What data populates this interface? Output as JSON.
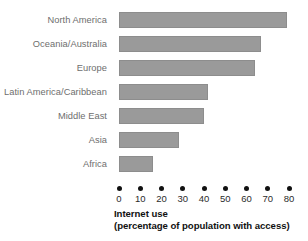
{
  "chart_data": {
    "type": "bar",
    "orientation": "horizontal",
    "title": "Internet use",
    "subtitle": "(percentage of population with access)",
    "xlabel": "Internet use (percentage of population with access)",
    "ylabel": "",
    "categories": [
      "North America",
      "Oceania/Australia",
      "Europe",
      "Latin America/Caribbean",
      "Middle East",
      "Asia",
      "Africa"
    ],
    "values": [
      79,
      67,
      64,
      42,
      40,
      28,
      16
    ],
    "xlim": [
      0,
      80
    ],
    "xticks": [
      0,
      10,
      20,
      30,
      40,
      50,
      60,
      70,
      80
    ],
    "xtick_labels": [
      "0",
      "10",
      "20",
      "30",
      "40",
      "50",
      "60",
      "70",
      "80"
    ],
    "grid": false,
    "legend": false,
    "bar_color": "#9a9a9a",
    "tick_marker": "dot",
    "background": "#ffffff"
  },
  "axis_title": {
    "line1": "Internet use",
    "line2": "(percentage of population with access)"
  }
}
